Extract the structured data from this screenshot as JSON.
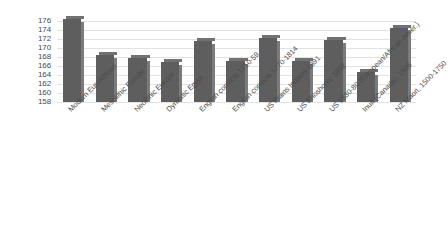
{
  "chart_data": {
    "type": "bar",
    "title": "",
    "subtitle": "",
    "xlabel": "",
    "ylabel": "",
    "ylim": [
      158,
      177
    ],
    "grid": true,
    "legend": false,
    "legend_position": "none",
    "bar_color": "#5e5e5e",
    "gridline_color": "#e2e2e2",
    "axis_text_color": "#4a4a4a",
    "background_color": "#ffffff",
    "yticks": [
      176,
      174,
      172,
      170,
      168,
      166,
      164,
      162,
      160,
      158
    ],
    "categories": [
      "Modern Eur./African",
      "Mesolithic Europe",
      "Neolithic Europe",
      "Dynastic Egypt",
      "English convicts 1710-59",
      "English convicts 1770-1814",
      "US Plains Indians 1891",
      "US Shoshona, 1892",
      "US 1830-80 (European/African-Amer.)",
      "Inuit (Canada), 1906",
      "NZ Maori, 1500-1750"
    ],
    "values": [
      176.6,
      168.6,
      167.8,
      167.0,
      171.6,
      167.1,
      172.3,
      167.1,
      171.8,
      164.8,
      174.6
    ]
  }
}
